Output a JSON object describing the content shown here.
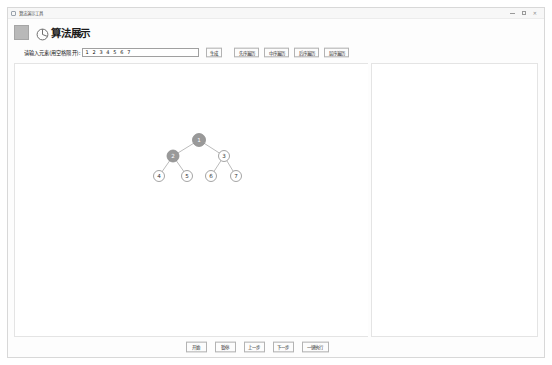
{
  "window": {
    "titlebar_text": "算法演示工具",
    "titlebar_icon": "app-icon",
    "controls": {
      "minimize": "minimize-icon",
      "maximize": "maximize-icon",
      "close": "✕"
    }
  },
  "header": {
    "logo_icon": "app-logo-icon",
    "glyph_icon": "tree-glyph-icon",
    "title": "算法展示"
  },
  "input_row": {
    "label": "请输入元素(用空格隔开):",
    "value": "1 2 3 4 5 6 7",
    "placeholder": "1 2 3 4 5 6 7",
    "generate_label": "生成",
    "traversals": [
      {
        "label": "先序遍历",
        "name": "preorder-traversal-button"
      },
      {
        "label": "中序遍历",
        "name": "inorder-traversal-button"
      },
      {
        "label": "后序遍历",
        "name": "postorder-traversal-button"
      },
      {
        "label": "层序遍历",
        "name": "levelorder-traversal-button"
      }
    ]
  },
  "footer": {
    "buttons": [
      {
        "label": "开始",
        "name": "start-button",
        "wide": false
      },
      {
        "label": "暂停",
        "name": "pause-button",
        "wide": false
      },
      {
        "label": "上一步",
        "name": "previous-step-button",
        "wide": false
      },
      {
        "label": "下一步",
        "name": "next-step-button",
        "wide": false
      },
      {
        "label": "一键执行",
        "name": "run-all-button",
        "wide": true
      }
    ]
  },
  "output_panel": {
    "content": ""
  },
  "colors": {
    "node_fill_default": "#ffffff",
    "node_fill_highlight": "#999999",
    "node_stroke": "#8d8d8d",
    "edge_stroke": "#aaaaaa",
    "node_text_default": "#333333",
    "node_text_highlight": "#ffffff",
    "panel_border": "#e4e4e4"
  },
  "tree": {
    "nodes": [
      {
        "id": "n1",
        "label": "1",
        "x": 198,
        "y": 139,
        "r": 6.5,
        "highlighted": true
      },
      {
        "id": "n2",
        "label": "2",
        "x": 172,
        "y": 155,
        "r": 6.0,
        "highlighted": true
      },
      {
        "id": "n3",
        "label": "3",
        "x": 223,
        "y": 155,
        "r": 5.5,
        "highlighted": false
      },
      {
        "id": "n4",
        "label": "4",
        "x": 158,
        "y": 175,
        "r": 5.5,
        "highlighted": false
      },
      {
        "id": "n5",
        "label": "5",
        "x": 186,
        "y": 175,
        "r": 5.5,
        "highlighted": false
      },
      {
        "id": "n6",
        "label": "6",
        "x": 210,
        "y": 175,
        "r": 5.5,
        "highlighted": false
      },
      {
        "id": "n7",
        "label": "7",
        "x": 235,
        "y": 175,
        "r": 5.5,
        "highlighted": false
      }
    ],
    "edges": [
      {
        "from": "n1",
        "to": "n2"
      },
      {
        "from": "n1",
        "to": "n3"
      },
      {
        "from": "n2",
        "to": "n4"
      },
      {
        "from": "n2",
        "to": "n5"
      },
      {
        "from": "n3",
        "to": "n6"
      },
      {
        "from": "n3",
        "to": "n7"
      }
    ]
  }
}
